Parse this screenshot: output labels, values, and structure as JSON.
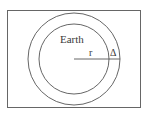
{
  "diagram": {
    "labels": {
      "earth": "Earth",
      "radius": "r",
      "delta": "Δ"
    },
    "colors": {
      "stroke": "#555555",
      "frame": "#666666",
      "text": "#3a3a3a",
      "background": "#ffffff"
    }
  }
}
